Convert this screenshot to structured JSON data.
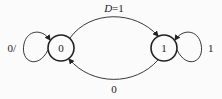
{
  "diagram": {
    "type": "state-diagram",
    "states": [
      {
        "id": "s0",
        "label": "0"
      },
      {
        "id": "s1",
        "label": "1"
      }
    ],
    "transitions": [
      {
        "from": "s0",
        "to": "s0",
        "label": "0/"
      },
      {
        "from": "s0",
        "to": "s1",
        "label_var": "D",
        "label_rest": "=1"
      },
      {
        "from": "s1",
        "to": "s1",
        "label": "1"
      },
      {
        "from": "s1",
        "to": "s0",
        "label": "0"
      }
    ],
    "colors": {
      "stroke": "#222222",
      "background": "#fbfbfb"
    }
  }
}
